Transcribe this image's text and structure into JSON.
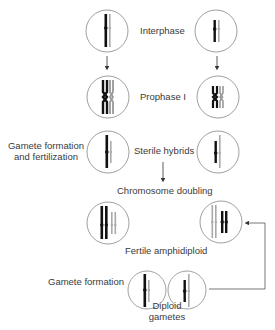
{
  "labels": {
    "interphase": "Interphase",
    "prophase": "Prophase I",
    "gamete_fert_line1": "Gamete formation",
    "gamete_fert_line2": "and fertilization",
    "sterile": "Sterile hybrids",
    "doubling": "Chromosome doubling",
    "fertile": "Fertile amphidiploid",
    "gamete_formation": "Gamete formation",
    "diploid_line1": "Diploid",
    "diploid_line2": "gametes"
  },
  "colors": {
    "dark_chromosome": "#111111",
    "light_chromosome": "#aaaaaa",
    "circle_stroke": "#777777",
    "arrow": "#333333"
  }
}
